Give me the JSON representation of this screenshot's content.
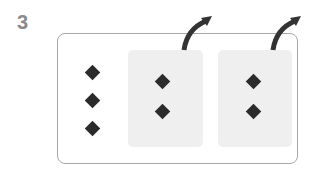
{
  "step": {
    "number": "3"
  },
  "colors": {
    "diamond": "#2b2b2b",
    "panel": "#efefef",
    "border": "#a8a8a8",
    "step_number": "#8a8a8a",
    "arrow": "#333333"
  },
  "groups": [
    {
      "name": "remaining",
      "diamond_count": 3,
      "highlighted": false
    },
    {
      "name": "moved-out-1",
      "diamond_count": 2,
      "highlighted": true,
      "arrow": "up-right"
    },
    {
      "name": "moved-out-2",
      "diamond_count": 2,
      "highlighted": true,
      "arrow": "up-right"
    }
  ]
}
